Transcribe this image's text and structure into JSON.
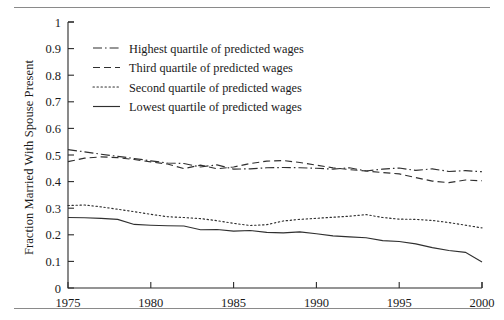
{
  "chart_data": {
    "type": "line",
    "title": "",
    "xlabel": "",
    "ylabel": "Fraction Married With Spouse Present",
    "xlim": [
      1975,
      2000
    ],
    "ylim": [
      0,
      1
    ],
    "xticks": [
      1975,
      1980,
      1985,
      1990,
      1995,
      2000
    ],
    "yticks": [
      "0",
      "0.1",
      "0.2",
      "0.3",
      "0.4",
      "0.5",
      "0.6",
      "0.7",
      "0.8",
      "0.9",
      "1"
    ],
    "grid": false,
    "legend_position": "upper-left-inside",
    "x": [
      1975,
      1976,
      1977,
      1978,
      1979,
      1980,
      1981,
      1982,
      1983,
      1984,
      1985,
      1986,
      1987,
      1988,
      1989,
      1990,
      1991,
      1992,
      1993,
      1994,
      1995,
      1996,
      1997,
      1998,
      1999,
      2000
    ],
    "series": [
      {
        "name": "Highest quartile of predicted wages",
        "linestyle": "dashdot",
        "values": [
          0.52,
          0.512,
          0.503,
          0.495,
          0.487,
          0.478,
          0.47,
          0.468,
          0.455,
          0.463,
          0.447,
          0.448,
          0.452,
          0.453,
          0.452,
          0.45,
          0.447,
          0.452,
          0.44,
          0.447,
          0.451,
          0.442,
          0.448,
          0.438,
          0.441,
          0.437
        ]
      },
      {
        "name": "Third quartile of predicted wages",
        "linestyle": "dashed",
        "values": [
          0.475,
          0.488,
          0.493,
          0.49,
          0.483,
          0.474,
          0.466,
          0.449,
          0.462,
          0.448,
          0.455,
          0.468,
          0.477,
          0.479,
          0.472,
          0.462,
          0.452,
          0.445,
          0.44,
          0.434,
          0.429,
          0.415,
          0.402,
          0.396,
          0.406,
          0.403
        ]
      },
      {
        "name": "Second quartile of predicted wages",
        "linestyle": "dotted",
        "values": [
          0.31,
          0.312,
          0.305,
          0.296,
          0.287,
          0.277,
          0.268,
          0.265,
          0.261,
          0.253,
          0.243,
          0.235,
          0.238,
          0.252,
          0.258,
          0.262,
          0.266,
          0.27,
          0.276,
          0.265,
          0.259,
          0.258,
          0.254,
          0.246,
          0.236,
          0.226
        ]
      },
      {
        "name": "Lowest quartile of predicted wages",
        "linestyle": "solid",
        "values": [
          0.265,
          0.264,
          0.262,
          0.258,
          0.239,
          0.236,
          0.234,
          0.233,
          0.219,
          0.22,
          0.214,
          0.216,
          0.209,
          0.207,
          0.211,
          0.204,
          0.196,
          0.192,
          0.189,
          0.178,
          0.175,
          0.166,
          0.152,
          0.141,
          0.134,
          0.098
        ]
      }
    ]
  },
  "axes": {
    "ylabel": "Fraction Married With Spouse Present",
    "yticks": [
      {
        "label": "1",
        "value": 1.0
      },
      {
        "label": "0.9",
        "value": 0.9
      },
      {
        "label": "0.8",
        "value": 0.8
      },
      {
        "label": "0.7",
        "value": 0.7
      },
      {
        "label": "0.6",
        "value": 0.6
      },
      {
        "label": "0.5",
        "value": 0.5
      },
      {
        "label": "0.4",
        "value": 0.4
      },
      {
        "label": "0.3",
        "value": 0.3
      },
      {
        "label": "0.2",
        "value": 0.2
      },
      {
        "label": "0.1",
        "value": 0.1
      },
      {
        "label": "0",
        "value": 0.0
      }
    ],
    "xticks": [
      {
        "label": "1975",
        "value": 1975
      },
      {
        "label": "1980",
        "value": 1980
      },
      {
        "label": "1985",
        "value": 1985
      },
      {
        "label": "1990",
        "value": 1990
      },
      {
        "label": "1995",
        "value": 1995
      },
      {
        "label": "2000",
        "value": 2000
      }
    ]
  },
  "legend": {
    "items": [
      {
        "label": "Highest quartile of predicted wages",
        "style": "dashdot"
      },
      {
        "label": "Third quartile of predicted wages",
        "style": "dashed"
      },
      {
        "label": "Second quartile of predicted wages",
        "style": "dotted"
      },
      {
        "label": "Lowest quartile of predicted wages",
        "style": "solid"
      }
    ]
  },
  "colors": {
    "line": "#2f2f2f",
    "axis": "#2b2b2b",
    "text": "#1a1a1a",
    "rule": "#8a8a8a",
    "background": "#ffffff"
  }
}
